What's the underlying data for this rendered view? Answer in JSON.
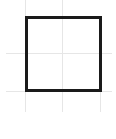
{
  "canvas": {
    "width": 116,
    "height": 139,
    "background": "#ffffff"
  },
  "grid": {
    "color": "#e6e6e6",
    "vertical": [
      {
        "x": 25,
        "y1": 0,
        "y2": 112
      },
      {
        "x": 62,
        "y1": 0,
        "y2": 112
      },
      {
        "x": 100,
        "y1": 16,
        "y2": 112
      }
    ],
    "horizontal": [
      {
        "y": 53,
        "x1": 6,
        "x2": 112
      },
      {
        "y": 91,
        "x1": 6,
        "x2": 112
      }
    ]
  },
  "shape": {
    "type": "square",
    "x": 25,
    "y": 16,
    "width": 77,
    "height": 76,
    "stroke": "#1a1a1a",
    "stroke_width": 3,
    "fill": "none"
  }
}
